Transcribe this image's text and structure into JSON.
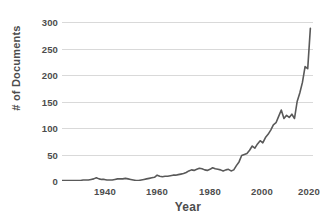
{
  "chart_data": {
    "type": "line",
    "title": "",
    "xlabel": "Year",
    "ylabel": "# of Documents",
    "xlim": [
      1925,
      2020
    ],
    "ylim": [
      0,
      300
    ],
    "xticks": [
      1940,
      1960,
      1980,
      2000,
      2020
    ],
    "xticklabels": [
      "1940",
      "1960",
      "1980",
      "2000",
      "2020"
    ],
    "yticks": [
      0,
      50,
      100,
      150,
      200,
      250,
      300
    ],
    "yticklabels": [
      "0",
      "50",
      "100",
      "150",
      "200",
      "250",
      "300"
    ],
    "grid": "horizontal",
    "legend": "none",
    "line_color": "#595959",
    "line_width": 1.6,
    "markers": "none",
    "x": [
      1925,
      1926,
      1927,
      1928,
      1929,
      1930,
      1931,
      1932,
      1933,
      1934,
      1935,
      1936,
      1937,
      1938,
      1939,
      1940,
      1941,
      1942,
      1943,
      1944,
      1945,
      1946,
      1947,
      1948,
      1949,
      1950,
      1951,
      1952,
      1953,
      1954,
      1955,
      1956,
      1957,
      1958,
      1959,
      1960,
      1961,
      1962,
      1963,
      1964,
      1965,
      1966,
      1967,
      1968,
      1969,
      1970,
      1971,
      1972,
      1973,
      1974,
      1975,
      1976,
      1977,
      1978,
      1979,
      1980,
      1981,
      1982,
      1983,
      1984,
      1985,
      1986,
      1987,
      1988,
      1989,
      1990,
      1991,
      1992,
      1993,
      1994,
      1995,
      1996,
      1997,
      1998,
      1999,
      2000,
      2001,
      2002,
      2003,
      2004,
      2005,
      2006,
      2007,
      2008,
      2009,
      2010,
      2011,
      2012,
      2013,
      2014,
      2015,
      2016,
      2017,
      2018,
      2019
    ],
    "y": [
      1,
      1,
      1,
      1,
      1,
      1,
      1,
      1,
      2,
      2,
      2,
      3,
      4,
      6,
      4,
      3,
      3,
      2,
      2,
      2,
      3,
      4,
      4,
      4,
      5,
      4,
      3,
      2,
      1,
      1,
      2,
      3,
      4,
      5,
      6,
      7,
      11,
      9,
      8,
      9,
      9,
      10,
      11,
      11,
      12,
      13,
      14,
      16,
      19,
      21,
      20,
      22,
      24,
      23,
      21,
      20,
      22,
      25,
      23,
      22,
      21,
      19,
      21,
      22,
      19,
      21,
      29,
      36,
      48,
      50,
      52,
      58,
      66,
      62,
      70,
      76,
      72,
      82,
      88,
      96,
      106,
      110,
      122,
      134,
      118,
      124,
      120,
      126,
      118,
      150,
      166,
      186,
      216,
      212,
      288
    ],
    "series": [
      {
        "name": "# of Documents",
        "values": [
          1,
          1,
          1,
          1,
          1,
          1,
          1,
          1,
          2,
          2,
          2,
          3,
          4,
          6,
          4,
          3,
          3,
          2,
          2,
          2,
          3,
          4,
          4,
          4,
          5,
          4,
          3,
          2,
          1,
          1,
          2,
          3,
          4,
          5,
          6,
          7,
          11,
          9,
          8,
          9,
          9,
          10,
          11,
          11,
          12,
          13,
          14,
          16,
          19,
          21,
          20,
          22,
          24,
          23,
          21,
          20,
          22,
          25,
          23,
          22,
          21,
          19,
          21,
          22,
          19,
          21,
          29,
          36,
          48,
          50,
          52,
          58,
          66,
          62,
          70,
          76,
          72,
          82,
          88,
          96,
          106,
          110,
          122,
          134,
          118,
          124,
          120,
          126,
          118,
          150,
          166,
          186,
          216,
          212,
          288
        ]
      }
    ],
    "annotations": []
  },
  "style": {
    "background": "#ffffff",
    "grid_color": "#d9d9d9",
    "axis_color": "#bfbfbf",
    "tick_text_color": "#4d4d4d",
    "line_color": "#595959"
  }
}
